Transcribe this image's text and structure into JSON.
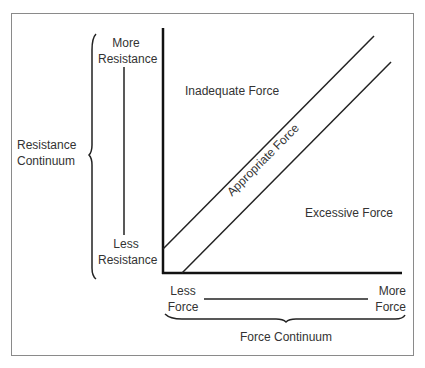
{
  "diagram": {
    "regions": {
      "inadequate": "Inadequate Force",
      "appropriate": "Appropriate Force",
      "excessive": "Excessive Force"
    },
    "y_axis": {
      "continuum_label_line1": "Resistance",
      "continuum_label_line2": "Continuum",
      "top_label_line1": "More",
      "top_label_line2": "Resistance",
      "bottom_label_line1": "Less",
      "bottom_label_line2": "Resistance"
    },
    "x_axis": {
      "continuum_label": "Force Continuum",
      "left_label_line1": "Less",
      "left_label_line2": "Force",
      "right_label_line1": "More",
      "right_label_line2": "Force"
    },
    "colors": {
      "line": "#111111",
      "text": "#333333",
      "frame": "#8a8a8a"
    }
  }
}
